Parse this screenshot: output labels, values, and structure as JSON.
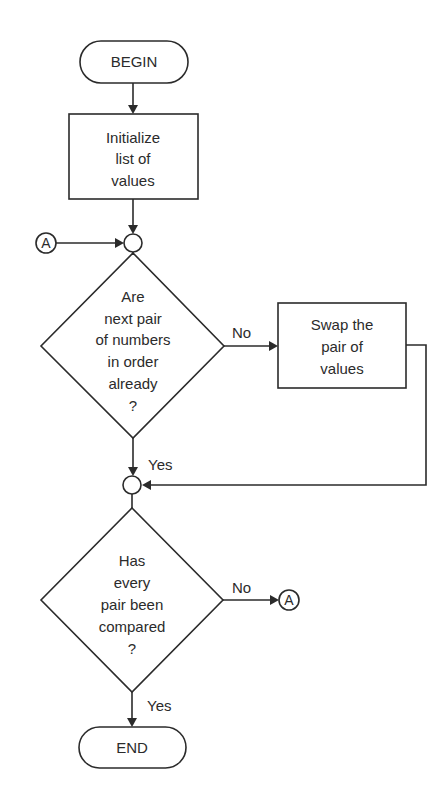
{
  "flowchart": {
    "begin": {
      "label": "BEGIN"
    },
    "initialize": {
      "lines": [
        "Initialize",
        "list of",
        "values"
      ]
    },
    "connector_in": {
      "label": "A"
    },
    "decision_order": {
      "lines": [
        "Are",
        "next pair",
        "of numbers",
        "in order",
        "already",
        "?"
      ]
    },
    "swap": {
      "lines": [
        "Swap the",
        "pair of",
        "values"
      ]
    },
    "decision_order_no": "No",
    "decision_order_yes": "Yes",
    "decision_compared": {
      "lines": [
        "Has",
        "every",
        "pair been",
        "compared",
        "?"
      ]
    },
    "decision_compared_no": "No",
    "decision_compared_yes": "Yes",
    "connector_out": {
      "label": "A"
    },
    "end": {
      "label": "END"
    }
  },
  "colors": {
    "stroke": "#2b2b2b",
    "background": "#ffffff"
  }
}
